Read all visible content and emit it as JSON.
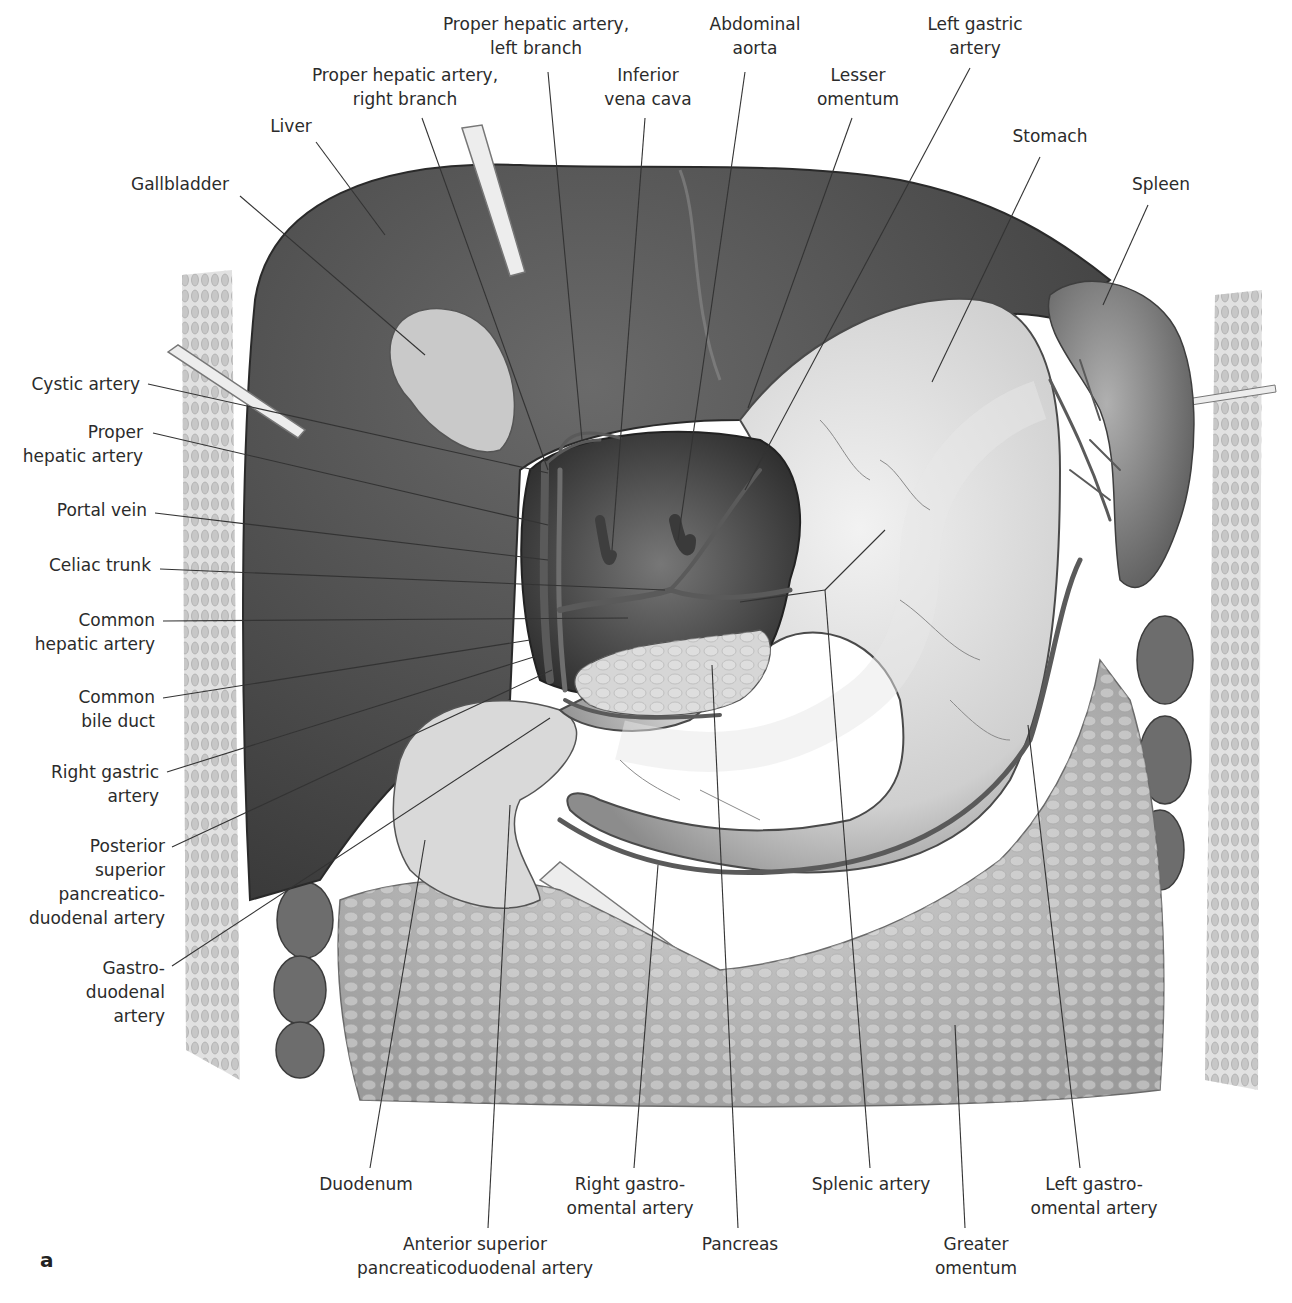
{
  "figure": {
    "letter": "a"
  },
  "labels": {
    "top": [
      {
        "id": "proper-hepatic-left",
        "lines": [
          "Proper hepatic artery,",
          "left branch"
        ]
      },
      {
        "id": "abdominal-aorta",
        "lines": [
          "Abdominal",
          "aorta"
        ]
      },
      {
        "id": "left-gastric-artery",
        "lines": [
          "Left gastric",
          "artery"
        ]
      },
      {
        "id": "proper-hepatic-right",
        "lines": [
          "Proper hepatic artery,",
          "right branch"
        ]
      },
      {
        "id": "inferior-vena-cava",
        "lines": [
          "Inferior",
          "vena cava"
        ]
      },
      {
        "id": "lesser-omentum",
        "lines": [
          "Lesser",
          "omentum"
        ]
      },
      {
        "id": "liver",
        "lines": [
          "Liver"
        ]
      },
      {
        "id": "stomach",
        "lines": [
          "Stomach"
        ]
      },
      {
        "id": "gallbladder",
        "lines": [
          "Gallbladder"
        ]
      },
      {
        "id": "spleen",
        "lines": [
          "Spleen"
        ]
      }
    ],
    "left": [
      {
        "id": "cystic-artery",
        "lines": [
          "Cystic artery"
        ]
      },
      {
        "id": "proper-hepatic-artery",
        "lines": [
          "Proper",
          "hepatic artery"
        ]
      },
      {
        "id": "portal-vein",
        "lines": [
          "Portal vein"
        ]
      },
      {
        "id": "celiac-trunk",
        "lines": [
          "Celiac trunk"
        ]
      },
      {
        "id": "common-hepatic-artery",
        "lines": [
          "Common",
          "hepatic artery"
        ]
      },
      {
        "id": "common-bile-duct",
        "lines": [
          "Common",
          "bile duct"
        ]
      },
      {
        "id": "right-gastric-artery",
        "lines": [
          "Right gastric",
          "artery"
        ]
      },
      {
        "id": "posterior-superior-pd-artery",
        "lines": [
          "Posterior",
          "superior",
          "pancreatico-",
          "duodenal artery"
        ]
      },
      {
        "id": "gastroduodenal-artery",
        "lines": [
          "Gastro-",
          "duodenal",
          "artery"
        ]
      }
    ],
    "bottom": [
      {
        "id": "duodenum",
        "lines": [
          "Duodenum"
        ]
      },
      {
        "id": "right-gastro-omental-artery",
        "lines": [
          "Right gastro-",
          "omental artery"
        ]
      },
      {
        "id": "splenic-artery",
        "lines": [
          "Splenic artery"
        ]
      },
      {
        "id": "left-gastro-omental-artery",
        "lines": [
          "Left gastro-",
          "omental artery"
        ]
      },
      {
        "id": "anterior-superior-pd-artery",
        "lines": [
          "Anterior superior",
          "pancreaticoduodenal artery"
        ]
      },
      {
        "id": "pancreas",
        "lines": [
          "Pancreas"
        ]
      },
      {
        "id": "greater-omentum",
        "lines": [
          "Greater",
          "omentum"
        ]
      }
    ]
  }
}
